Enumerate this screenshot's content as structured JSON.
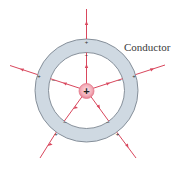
{
  "diagram": {
    "label": "Conductor",
    "center_charge": {
      "symbol": "+",
      "color": "#f3b7c0",
      "stroke": "#d9566b"
    },
    "shell": {
      "fill": "#cfd9e2",
      "stroke": "#7a8590",
      "outer_radius": 51.5,
      "inner_radius": 38
    },
    "field_line_color": "#d9475d",
    "induced_inner_charge": "−",
    "induced_outer_charge": "+",
    "field_line_count": 5
  }
}
